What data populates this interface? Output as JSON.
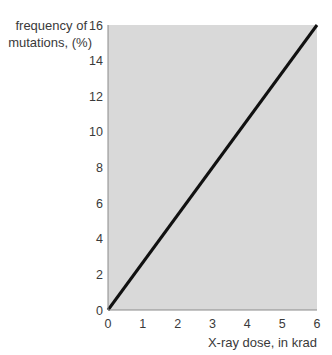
{
  "chart_data": {
    "type": "line",
    "title": "",
    "ylabel_lines": [
      "frequency of",
      "mutations, (%)"
    ],
    "xlabel": "X-ray dose, in krad",
    "xlim": [
      0,
      6
    ],
    "ylim": [
      0,
      16
    ],
    "x_ticks": [
      0,
      1,
      2,
      3,
      4,
      5,
      6
    ],
    "y_ticks": [
      0,
      2,
      4,
      6,
      8,
      10,
      12,
      14,
      16
    ],
    "grid": false,
    "plot_background": "#d9d9d9",
    "series": [
      {
        "name": "mutation frequency",
        "color": "#111111",
        "x": [
          0,
          6
        ],
        "y": [
          0,
          16
        ]
      }
    ]
  }
}
